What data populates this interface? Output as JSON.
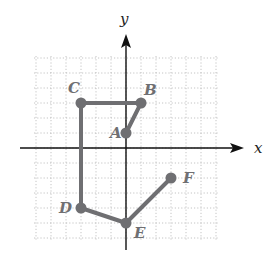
{
  "diagram": {
    "type": "coordinate-plane-path",
    "axes": {
      "x_label": "x",
      "y_label": "y"
    },
    "grid": {
      "x_min": -6,
      "x_max": 6,
      "y_min": -6,
      "y_max": 6,
      "spacing": 1
    },
    "points": [
      {
        "label": "A",
        "x": 0,
        "y": 1
      },
      {
        "label": "B",
        "x": 1,
        "y": 3
      },
      {
        "label": "C",
        "x": -3,
        "y": 3
      },
      {
        "label": "D",
        "x": -3,
        "y": -4
      },
      {
        "label": "E",
        "x": 0,
        "y": -5
      },
      {
        "label": "F",
        "x": 3,
        "y": -2
      }
    ],
    "path_order": [
      "A",
      "B",
      "C",
      "D",
      "E",
      "F"
    ],
    "colors": {
      "path": "#6f6f72",
      "grid": "#b5b5b5",
      "axis": "#111111"
    }
  }
}
